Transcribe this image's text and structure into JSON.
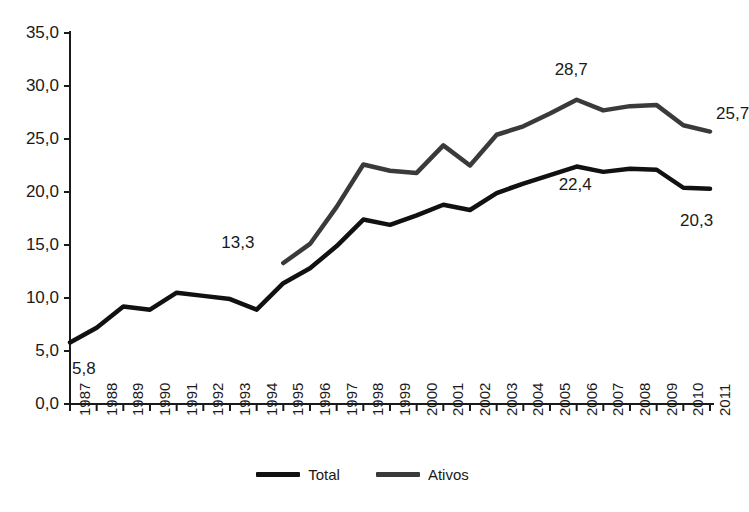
{
  "chart_data": {
    "type": "line",
    "title": "",
    "subtitle": "",
    "xlabel": "",
    "ylabel": "",
    "grid": false,
    "legend_position": "bottom-center",
    "xlim": [
      1987,
      2011
    ],
    "ylim": [
      0,
      35
    ],
    "ytick_step": 5,
    "categories": [
      "1987",
      "1988",
      "1989",
      "1990",
      "1991",
      "1992",
      "1993",
      "1994",
      "1995",
      "1996",
      "1997",
      "1998",
      "1999",
      "2000",
      "2001",
      "2002",
      "2003",
      "2004",
      "2005",
      "2006",
      "2007",
      "2008",
      "2009",
      "2010",
      "2011"
    ],
    "ytick_labels": [
      "0,0",
      "5,0",
      "10,0",
      "15,0",
      "20,0",
      "25,0",
      "30,0",
      "35,0"
    ],
    "ytick_values": [
      0,
      5,
      10,
      15,
      20,
      25,
      30,
      35
    ],
    "series": [
      {
        "name": "Total",
        "color": "#111111",
        "x": [
          "1987",
          "1988",
          "1989",
          "1990",
          "1991",
          "1992",
          "1993",
          "1994",
          "1995",
          "1996",
          "1997",
          "1998",
          "1999",
          "2000",
          "2001",
          "2002",
          "2003",
          "2004",
          "2005",
          "2006",
          "2007",
          "2008",
          "2009",
          "2010",
          "2011"
        ],
        "values": [
          5.8,
          7.2,
          9.2,
          8.9,
          10.5,
          10.2,
          9.9,
          8.9,
          11.4,
          12.8,
          14.9,
          17.4,
          16.9,
          17.8,
          18.8,
          18.3,
          19.9,
          20.8,
          21.6,
          22.4,
          21.9,
          22.2,
          22.1,
          20.4,
          20.3
        ],
        "annotations": [
          {
            "label": "5,8",
            "x": "1987",
            "y": 5.8
          },
          {
            "label": "22,4",
            "x": "2006",
            "y": 22.4
          },
          {
            "label": "20,3",
            "x": "2011",
            "y": 20.3
          }
        ]
      },
      {
        "name": "Ativos",
        "color": "#3a3a3a",
        "x": [
          "1995",
          "1996",
          "1997",
          "1998",
          "1999",
          "2000",
          "2001",
          "2002",
          "2003",
          "2004",
          "2005",
          "2006",
          "2007",
          "2008",
          "2009",
          "2010",
          "2011"
        ],
        "values": [
          13.3,
          15.1,
          18.6,
          22.6,
          22.0,
          21.8,
          24.4,
          22.5,
          25.4,
          26.2,
          27.4,
          28.7,
          27.7,
          28.1,
          28.2,
          26.3,
          25.7
        ],
        "annotations": [
          {
            "label": "13,3",
            "x": "1995",
            "y": 13.3
          },
          {
            "label": "28,7",
            "x": "2006",
            "y": 28.7
          },
          {
            "label": "25,7",
            "x": "2011",
            "y": 25.7
          }
        ]
      }
    ],
    "legend": [
      {
        "label": "Total",
        "color": "#111111"
      },
      {
        "label": "Ativos",
        "color": "#3a3a3a"
      }
    ]
  },
  "annotations": {
    "total_start": "5,8",
    "total_peak": "22,4",
    "total_end": "20,3",
    "ativos_start": "13,3",
    "ativos_peak": "28,7",
    "ativos_end": "25,7"
  },
  "axis": {
    "color": "#1a1a1a"
  }
}
